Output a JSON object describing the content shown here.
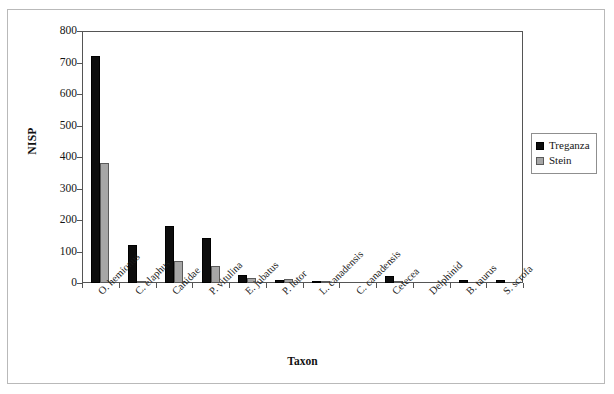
{
  "chart_data": {
    "type": "bar",
    "title": "",
    "xlabel": "Taxon",
    "ylabel": "NISP",
    "ylim": [
      0,
      800
    ],
    "ytick_step": 100,
    "yticks": [
      "0",
      "100",
      "200",
      "300",
      "400",
      "500",
      "600",
      "700",
      "800"
    ],
    "grid": false,
    "legend_position": "right",
    "categories": [
      "O. hemionus",
      "C. elaphus",
      "Canidae",
      "P. vitulina",
      "E. jubatus",
      "P. lotor",
      "L. canadensis",
      "C. canadensis",
      "Cetecea",
      "Delphinid",
      "B. taurus",
      "S. scrofa"
    ],
    "series": [
      {
        "name": "Treganza",
        "color": "#0d0d0d",
        "values": [
          722,
          122,
          180,
          143,
          26,
          10,
          3,
          0,
          21,
          0,
          8,
          8
        ]
      },
      {
        "name": "Stein",
        "color": "#a6a6a6",
        "values": [
          380,
          7,
          70,
          55,
          15,
          12,
          2,
          0,
          5,
          0,
          0,
          0
        ]
      }
    ]
  },
  "legend": {
    "items": [
      {
        "label": "Treganza",
        "color": "#0d0d0d"
      },
      {
        "label": "Stein",
        "color": "#a6a6a6"
      }
    ]
  }
}
